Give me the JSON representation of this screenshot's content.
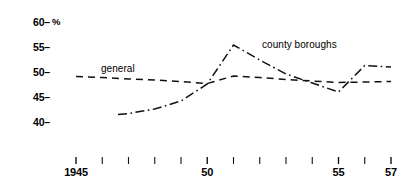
{
  "chart_data": {
    "type": "line",
    "title": "",
    "subtitle": "",
    "xlabel": "",
    "ylabel": "%",
    "ylim": [
      38,
      61
    ],
    "xlim": [
      1944.4,
      1957.6
    ],
    "grid": false,
    "legend_position": "inline-labels",
    "y_ticks": [
      {
        "value": 60,
        "label": "60"
      },
      {
        "value": 55,
        "label": "55"
      },
      {
        "value": 50,
        "label": "50"
      },
      {
        "value": 45,
        "label": "45"
      },
      {
        "value": 40,
        "label": "40"
      }
    ],
    "y_tick_mark": "–",
    "x_ticks": [
      {
        "value": 1945,
        "label": "1945"
      },
      {
        "value": 1946,
        "label": ""
      },
      {
        "value": 1947,
        "label": ""
      },
      {
        "value": 1948,
        "label": ""
      },
      {
        "value": 1949,
        "label": ""
      },
      {
        "value": 1950,
        "label": "50"
      },
      {
        "value": 1951,
        "label": ""
      },
      {
        "value": 1952,
        "label": ""
      },
      {
        "value": 1953,
        "label": ""
      },
      {
        "value": 1954,
        "label": ""
      },
      {
        "value": 1955,
        "label": "55"
      },
      {
        "value": 1956,
        "label": ""
      },
      {
        "value": 1957,
        "label": "57"
      }
    ],
    "series": [
      {
        "name": "general",
        "label": "general",
        "linestyle": "dashed",
        "color": "#111111",
        "x": [
          1945.0,
          1946.0,
          1947.0,
          1948.0,
          1949.0,
          1950.0,
          1951.0,
          1952.0,
          1953.0,
          1954.0,
          1955.0,
          1956.0,
          1957.0
        ],
        "values": [
          49.1,
          48.9,
          48.6,
          48.4,
          48.1,
          47.7,
          49.2,
          48.9,
          48.5,
          48.2,
          47.9,
          48.0,
          48.1
        ]
      },
      {
        "name": "county boroughs",
        "label": "county boroughs",
        "linestyle": "dashdot",
        "color": "#111111",
        "x": [
          1946.6,
          1947.0,
          1948.0,
          1949.0,
          1950.0,
          1951.0,
          1952.0,
          1953.0,
          1954.0,
          1955.0,
          1956.0,
          1957.0
        ],
        "values": [
          41.5,
          41.7,
          42.6,
          44.2,
          47.6,
          55.4,
          52.4,
          49.6,
          47.8,
          46.0,
          51.3,
          51.0
        ]
      }
    ],
    "annotations": [
      {
        "text": "general",
        "x": 1946.3,
        "y": 50.2
      },
      {
        "text": "county boroughs",
        "x": 1951.8,
        "y": 55.0
      }
    ]
  }
}
